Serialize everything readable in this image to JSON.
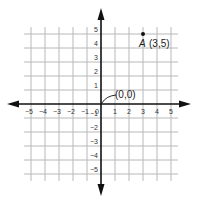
{
  "diagram": {
    "type": "coordinate-plane",
    "x_range": [
      -5,
      5
    ],
    "y_range": [
      -5,
      5
    ],
    "x_ticks": [
      "-5",
      "-4",
      "-3",
      "-2",
      "-1",
      "0",
      "1",
      "2",
      "3",
      "4",
      "5"
    ],
    "y_ticks": [
      "5",
      "4",
      "3",
      "2",
      "1",
      "-1",
      "-2",
      "-3",
      "-4",
      "-5"
    ],
    "origin_label": "(0,0)",
    "points": [
      {
        "name": "A",
        "coords": "(3,5)",
        "x": 3,
        "y": 5
      }
    ],
    "colors": {
      "grid": "#b8b8b8",
      "axis": "#111111",
      "point": "#111111"
    }
  }
}
